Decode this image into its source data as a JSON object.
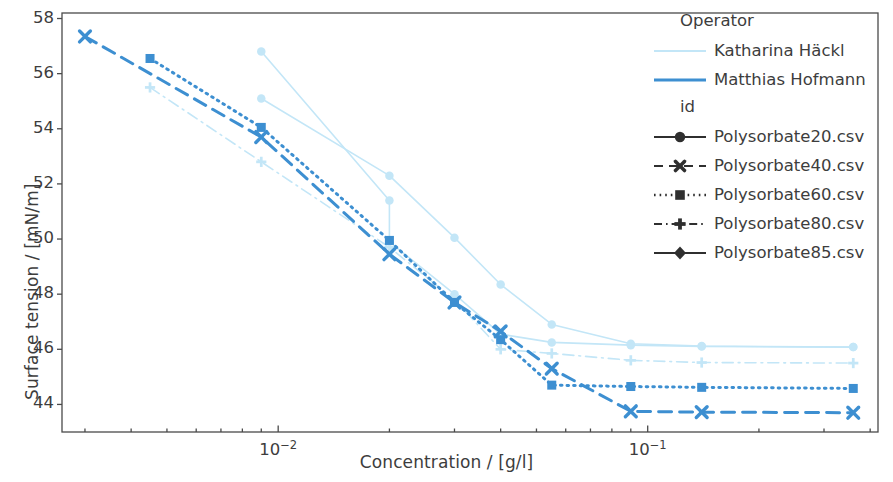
{
  "chart_data": {
    "type": "line",
    "title": "",
    "xlabel": "Concentration / [g/l]",
    "ylabel": "Surface tension / [mN/m]",
    "xscale": "log",
    "yscale": "linear",
    "xlim": [
      0.0026,
      0.42
    ],
    "ylim": [
      43.0,
      58.2
    ],
    "yticks": [
      44,
      46,
      48,
      50,
      52,
      54,
      56,
      58
    ],
    "xticks": [
      0.01,
      0.1
    ],
    "xtick_labels": [
      "10⁻²",
      "10⁻¹"
    ],
    "grid": false,
    "legend_position": "upper right",
    "legend_titles": [
      "Operator",
      "id"
    ],
    "operators": [
      {
        "name": "Katharina Häckl",
        "color": "#c3e6f7",
        "linewidth": 1.4
      },
      {
        "name": "Matthias Hofmann",
        "color": "#3d8fd1",
        "linewidth": 2.6
      }
    ],
    "ids": [
      {
        "name": "Polysorbate20.csv",
        "marker": "circle",
        "dash": "solid"
      },
      {
        "name": "Polysorbate40.csv",
        "marker": "x",
        "dash": "dashed"
      },
      {
        "name": "Polysorbate60.csv",
        "marker": "square",
        "dash": "dotted"
      },
      {
        "name": "Polysorbate80.csv",
        "marker": "plus",
        "dash": "dashdot"
      },
      {
        "name": "Polysorbate85.csv",
        "marker": "diamond",
        "dash": "solid"
      }
    ],
    "series": [
      {
        "name": "Polysorbate20.csv",
        "operator": "Katharina Häckl",
        "id": "Polysorbate20.csv",
        "color": "#c3e6f7",
        "marker": "circle",
        "dash": "solid",
        "x": [
          0.009,
          0.02,
          0.02,
          0.03,
          0.04,
          0.055,
          0.09,
          0.14,
          0.36
        ],
        "y": [
          56.8,
          51.4,
          49.9,
          48.0,
          46.55,
          46.25,
          46.15,
          46.1,
          46.08
        ]
      },
      {
        "name": "Polysorbate20.csv (b)",
        "operator": "Katharina Häckl",
        "id": "Polysorbate20.csv",
        "color": "#c3e6f7",
        "marker": "circle",
        "dash": "solid",
        "x": [
          0.009,
          0.02,
          0.03,
          0.04,
          0.055,
          0.09,
          0.14,
          0.36
        ],
        "y": [
          55.1,
          52.3,
          50.05,
          48.35,
          46.9,
          46.2,
          46.12,
          46.08
        ]
      },
      {
        "name": "Polysorbate80.csv",
        "operator": "Katharina Häckl",
        "id": "Polysorbate80.csv",
        "color": "#c3e6f7",
        "marker": "plus",
        "dash": "dashdot",
        "x": [
          0.0045,
          0.009,
          0.02,
          0.03,
          0.04,
          0.055,
          0.09,
          0.14,
          0.36
        ],
        "y": [
          55.5,
          52.8,
          49.7,
          47.8,
          46.0,
          45.85,
          45.6,
          45.52,
          45.5
        ]
      },
      {
        "name": "Polysorbate40.csv",
        "operator": "Matthias Hofmann",
        "id": "Polysorbate40.csv",
        "color": "#3d8fd1",
        "marker": "x",
        "dash": "dashed",
        "x": [
          0.003,
          0.009,
          0.02,
          0.03,
          0.04,
          0.055,
          0.09,
          0.14,
          0.36
        ],
        "y": [
          57.35,
          53.7,
          49.45,
          47.7,
          46.65,
          45.3,
          43.75,
          43.72,
          43.7
        ]
      },
      {
        "name": "Polysorbate60.csv",
        "operator": "Matthias Hofmann",
        "id": "Polysorbate60.csv",
        "color": "#3d8fd1",
        "marker": "square",
        "dash": "dotted",
        "x": [
          0.0045,
          0.009,
          0.02,
          0.03,
          0.04,
          0.055,
          0.09,
          0.14,
          0.36
        ],
        "y": [
          56.55,
          54.05,
          49.95,
          47.7,
          46.35,
          44.7,
          44.65,
          44.62,
          44.58
        ]
      }
    ]
  },
  "legend": {
    "operator_heading": "Operator",
    "id_heading": "id",
    "operator_items": [
      {
        "label": "Katharina Häckl"
      },
      {
        "label": "Matthias Hofmann"
      }
    ],
    "id_items": [
      {
        "label": "Polysorbate20.csv"
      },
      {
        "label": "Polysorbate40.csv"
      },
      {
        "label": "Polysorbate60.csv"
      },
      {
        "label": "Polysorbate80.csv"
      },
      {
        "label": "Polysorbate85.csv"
      }
    ]
  },
  "axes": {
    "xlabel": "Concentration / [g/l]",
    "ylabel": "Surface tension / [mN/m]",
    "ytick_labels": [
      "58",
      "56",
      "54",
      "52",
      "50",
      "48",
      "46",
      "44"
    ],
    "xtick_labels": [
      "10",
      "10"
    ],
    "xtick_exponents": [
      "−2",
      "−1"
    ]
  },
  "colors": {
    "light_blue": "#c3e6f7",
    "medium_blue": "#3d8fd1",
    "axis": "#3b3b3b",
    "background": "#ffffff"
  }
}
